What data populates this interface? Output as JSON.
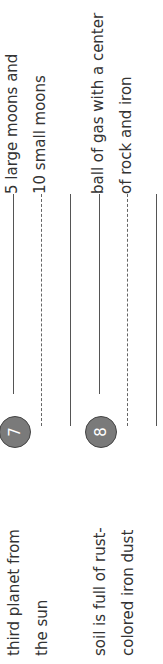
{
  "worksheet": {
    "items": [
      {
        "number": "7",
        "clue_line1": "third planet from",
        "clue_line2": "the sun",
        "answer_line1": "5 large moons and",
        "answer_line2": "10 small moons"
      },
      {
        "number": "8",
        "clue_line1": "soil is full of rust-",
        "clue_line2": "colored iron dust",
        "answer_line1": "ball of gas with a center",
        "answer_line2": "of rock and iron"
      }
    ]
  },
  "colors": {
    "circle_fill": "#7a7a7a",
    "text": "#333333",
    "lines": "#555555"
  }
}
